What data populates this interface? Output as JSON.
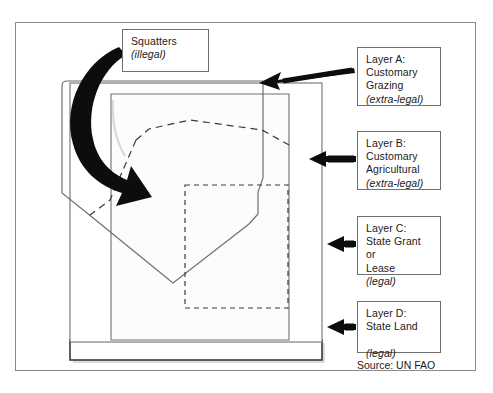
{
  "diagram": {
    "source_note": "Source: UN FAO",
    "callouts": {
      "squatters": {
        "label": "Squatters",
        "status": "(illegal)"
      },
      "layer_a": {
        "line1": "Layer A:",
        "line2": "Customary",
        "line3": "Grazing",
        "status": "(extra-legal)"
      },
      "layer_b": {
        "line1": "Layer B:",
        "line2": "Customary",
        "line3": "Agricultural",
        "status": "(extra-legal)"
      },
      "layer_c": {
        "line1": "Layer C:",
        "line2": "State Grant or",
        "line3": "Lease",
        "status": "(legal)"
      },
      "layer_d": {
        "line1": "Layer D:",
        "line2": "State Land",
        "line3": "",
        "status": "(legal)"
      }
    },
    "shapes": {
      "layer_a_name": "layer-a-customary-grazing-region",
      "layer_b_name": "layer-b-customary-agricultural-region",
      "layer_c_name": "layer-c-state-grant-lease-region",
      "layer_d_name": "layer-d-state-land-region",
      "squatter_arrow_name": "squatters-curved-arrow"
    },
    "colors": {
      "outline": "#6f6f6f",
      "frame": "#8a8a8a",
      "arrow": "#0d0d0d",
      "fill_shade": "#f2f2f2",
      "text": "#1a1a1a",
      "background": "#ffffff"
    }
  }
}
